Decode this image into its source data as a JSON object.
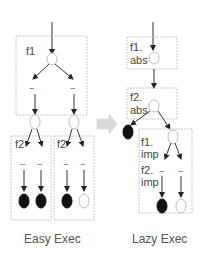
{
  "diagram": {
    "left": {
      "caption": "Easy Exec",
      "box_f1_label": "f1",
      "box_f2a_label": "f2",
      "box_f2b_label": "f2",
      "ellipsis": "..."
    },
    "right": {
      "caption": "Lazy Exec",
      "box_f1_abs_label_line1": "f1.",
      "box_f1_abs_label_line2": "abs",
      "box_f2_abs_label_line1": "f2.",
      "box_f2_abs_label_line2": "abs",
      "box_imp_f1_line1": "f1.",
      "box_imp_f1_line2": "imp",
      "box_imp_f2_line1": "f2.",
      "box_imp_f2_line2": "imp",
      "ellipsis": "..."
    },
    "transition_arrow": "right-arrow",
    "colors": {
      "filled_node": "#111111",
      "open_node_stroke": "#bdbdbd",
      "box_stroke": "#c8c8c8",
      "edge": "#333333"
    }
  }
}
